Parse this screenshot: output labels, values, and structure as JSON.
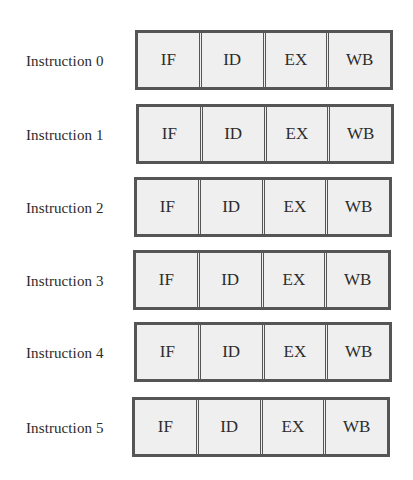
{
  "diagram": {
    "rows": [
      {
        "label": "Instruction 0",
        "stages": [
          "IF",
          "ID",
          "EX",
          "WB"
        ]
      },
      {
        "label": "Instruction 1",
        "stages": [
          "IF",
          "ID",
          "EX",
          "WB"
        ]
      },
      {
        "label": "Instruction 2",
        "stages": [
          "IF",
          "ID",
          "EX",
          "WB"
        ]
      },
      {
        "label": "Instruction 3",
        "stages": [
          "IF",
          "ID",
          "EX",
          "WB"
        ]
      },
      {
        "label": "Instruction 4",
        "stages": [
          "IF",
          "ID",
          "EX",
          "WB"
        ]
      },
      {
        "label": "Instruction 5",
        "stages": [
          "IF",
          "ID",
          "EX",
          "WB"
        ]
      }
    ]
  }
}
